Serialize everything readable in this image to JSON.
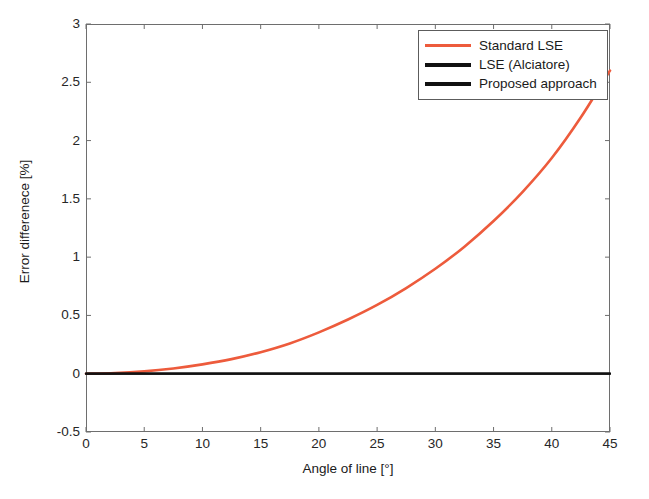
{
  "figure": {
    "background": "#ffffff"
  },
  "chart_data": {
    "type": "line",
    "title": "",
    "subtitle": "",
    "xlabel": "Angle of line [°]",
    "ylabel": "Error differenece [%]",
    "xlim": [
      0,
      45
    ],
    "ylim": [
      -0.5,
      3
    ],
    "xticks": [
      0,
      5,
      10,
      15,
      20,
      25,
      30,
      35,
      40,
      45
    ],
    "xticklabels": [
      "0",
      "5",
      "10",
      "15",
      "20",
      "25",
      "30",
      "35",
      "40",
      "45"
    ],
    "yticks": [
      -0.5,
      0,
      0.5,
      1,
      1.5,
      2,
      2.5,
      3
    ],
    "yticklabels": [
      "-0.5",
      "0",
      "0.5",
      "1",
      "1.5",
      "2",
      "2.5",
      "3"
    ],
    "grid": false,
    "legend_position": "upper-right",
    "x": [
      0,
      2.5,
      5,
      7.5,
      10,
      12.5,
      15,
      17.5,
      20,
      22.5,
      25,
      27.5,
      30,
      32.5,
      35,
      37.5,
      40,
      42.5,
      45
    ],
    "series": [
      {
        "name": "Standard LSE",
        "color": "#ED5B3C",
        "linewidth": 2.6,
        "values": [
          0.0,
          0.005,
          0.02,
          0.045,
          0.08,
          0.125,
          0.185,
          0.26,
          0.355,
          0.465,
          0.59,
          0.735,
          0.9,
          1.09,
          1.31,
          1.56,
          1.85,
          2.2,
          2.6
        ]
      },
      {
        "name": "LSE (Alciatore)",
        "color": "#111111",
        "linewidth": 2.2,
        "values": [
          0,
          0,
          0,
          0,
          0,
          0,
          0,
          0,
          0,
          0,
          0,
          0,
          0,
          0,
          0,
          0,
          0,
          0,
          0
        ]
      },
      {
        "name": "Proposed approach",
        "color": "#111111",
        "linewidth": 2.2,
        "values": [
          0,
          0,
          0,
          0,
          0,
          0,
          0,
          0,
          0,
          0,
          0,
          0,
          0,
          0,
          0,
          0,
          0,
          0,
          0
        ]
      }
    ]
  },
  "legend": {
    "items": [
      {
        "label": "Standard LSE",
        "color": "#ED5B3C",
        "thickness": "3px"
      },
      {
        "label": "LSE (Alciatore)",
        "color": "#111111",
        "thickness": "4px"
      },
      {
        "label": "Proposed approach",
        "color": "#111111",
        "thickness": "4px"
      }
    ]
  },
  "axes": {
    "frame_color": "#6e6e6e",
    "tick_color": "#6e6e6e"
  }
}
